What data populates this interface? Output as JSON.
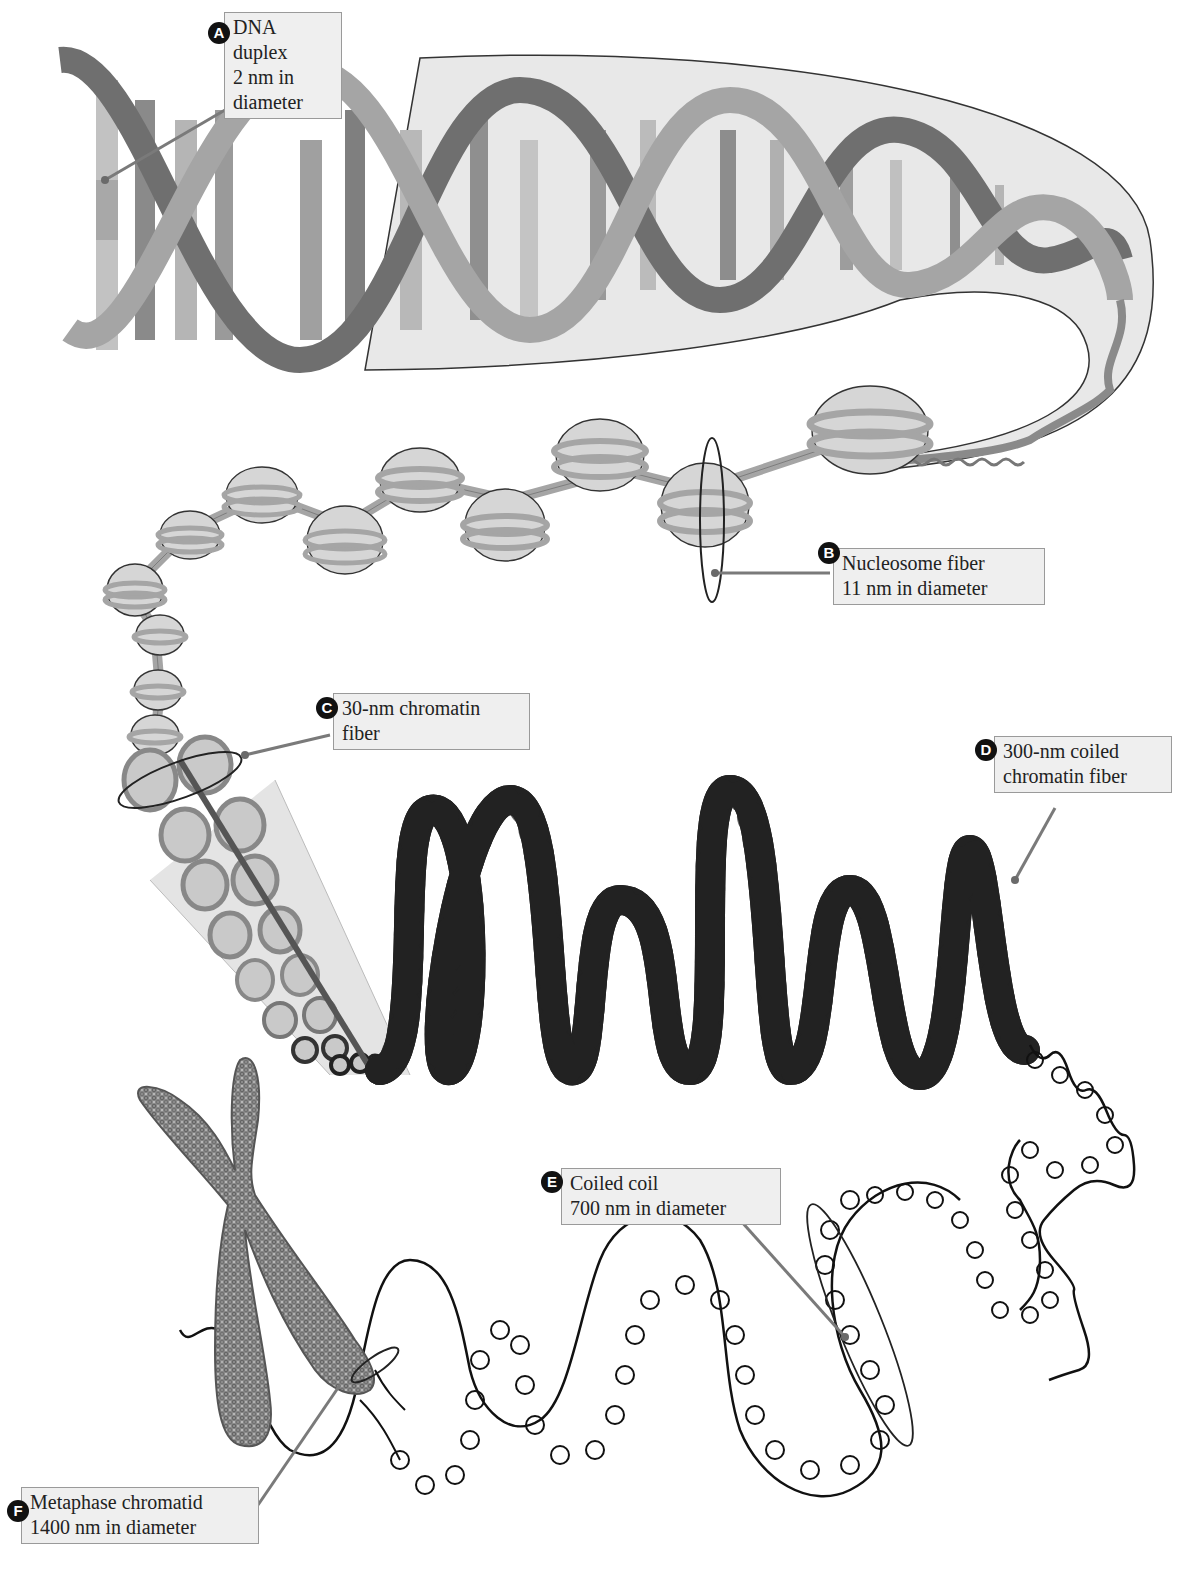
{
  "diagram": {
    "colors": {
      "label_bg": "#efefef",
      "label_border": "#9a9a9a",
      "badge": "#111111",
      "leader_line": "#7a7a7a",
      "dna_strand": "#9c9c9c",
      "nucleosome_fill": "#d6d6d6",
      "fiber_fill": "#c4c4c4",
      "outline": "#1a1a1a"
    },
    "labels": [
      {
        "id": "A",
        "badge": "A",
        "lines": [
          "DNA",
          "duplex",
          "2 nm in",
          "diameter"
        ]
      },
      {
        "id": "B",
        "badge": "B",
        "lines": [
          "Nucleosome fiber",
          "11 nm in diameter"
        ]
      },
      {
        "id": "C",
        "badge": "C",
        "lines": [
          "30-nm chromatin",
          "fiber"
        ]
      },
      {
        "id": "D",
        "badge": "D",
        "lines": [
          "300-nm coiled",
          "chromatin fiber"
        ]
      },
      {
        "id": "E",
        "badge": "E",
        "lines": [
          "Coiled coil",
          "700 nm in diameter"
        ]
      },
      {
        "id": "F",
        "badge": "F",
        "lines": [
          "Metaphase chromatid",
          "1400 nm in diameter"
        ]
      }
    ]
  }
}
